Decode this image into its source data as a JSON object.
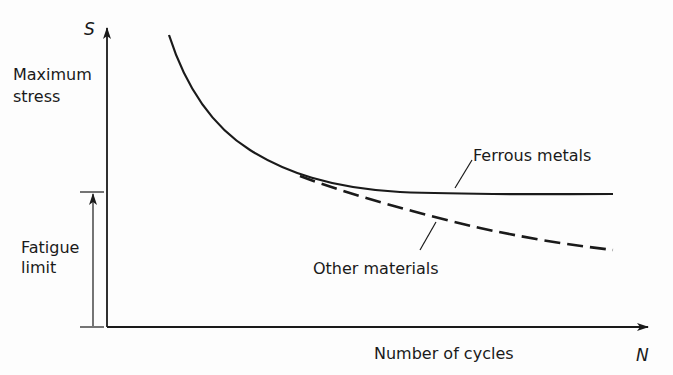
{
  "diagram": {
    "type": "S-N fatigue curve",
    "y_axis": {
      "symbol": "S",
      "label_line1": "Maximum",
      "label_line2": "stress"
    },
    "x_axis": {
      "symbol": "N",
      "label": "Number of cycles"
    },
    "dimension": {
      "label_line1": "Fatigue",
      "label_line2": "limit"
    },
    "curves": [
      {
        "name": "Ferrous metals",
        "style": "solid",
        "behavior": "levels off at fatigue limit"
      },
      {
        "name": "Other materials",
        "style": "dashed",
        "behavior": "continues decreasing"
      }
    ],
    "colors": {
      "ink": "#1a1a1a",
      "background": "#fdfdfd"
    }
  }
}
